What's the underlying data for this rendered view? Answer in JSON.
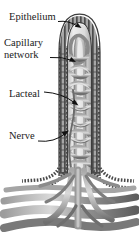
{
  "figure": {
    "background_color": "#ffffff",
    "ink_color": "#1a1a1a",
    "style": "grayscale anatomical illustration"
  },
  "labels": [
    {
      "id": "epithelium",
      "text": "Epithelium",
      "x": 9,
      "y": 11
    },
    {
      "id": "capillary",
      "text": "Capillary",
      "line2": "network",
      "x": 4,
      "y": 37
    },
    {
      "id": "lacteal",
      "text": "Lacteal",
      "x": 9,
      "y": 88
    },
    {
      "id": "nerve",
      "text": "Nerve",
      "x": 9,
      "y": 130
    }
  ],
  "leader_lines": [
    {
      "for": "epithelium",
      "from_x": 60,
      "from_y": 21,
      "to_x": 81,
      "to_y": 26
    },
    {
      "for": "capillary",
      "from_x": 52,
      "from_y": 58,
      "to_x": 75,
      "to_y": 60
    },
    {
      "for": "lacteal",
      "from_x": 45,
      "from_y": 92,
      "to_x": 78,
      "to_y": 104
    },
    {
      "for": "nerve",
      "from_x": 40,
      "from_y": 140,
      "to_x": 70,
      "to_y": 130
    }
  ],
  "structures": {
    "epithelium": "outer striated columnar cell border of the villus",
    "capillary_network": "branching vessel mesh inside the villus core",
    "lacteal": "central lymphatic vessel running up the villus axis",
    "nerve": "slender fiber ascending beside the lacteal",
    "base_vessels": "horizontal arteriole / venule / lymphatic bundles at the villus base"
  },
  "palette": {
    "epithelium_dark": "#4a4a4a",
    "epithelium_mid": "#7d7d7d",
    "epithelium_light": "#b8b8b8",
    "core_pale": "#e2e2e2",
    "vessel_mid": "#8e8e8e",
    "vessel_dark": "#5b5b5b",
    "vessel_light": "#c9c9c9",
    "lacteal_fill": "#d6d6d6",
    "outline": "#3a3a3a"
  }
}
